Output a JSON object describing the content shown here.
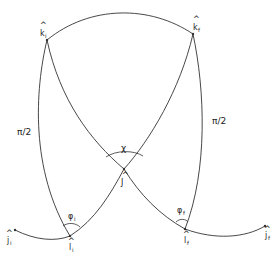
{
  "diagram": {
    "title": "",
    "points": {
      "k_i": {
        "label": "k",
        "hat": "^",
        "sub": "i",
        "x": 47,
        "y": 40
      },
      "k_f": {
        "label": "k",
        "hat": "^",
        "sub": "f",
        "x": 193,
        "y": 34
      },
      "J": {
        "label": "J",
        "hat": "^",
        "x": 124,
        "y": 169
      },
      "l_i": {
        "label": "l",
        "hat": "^",
        "sub": "i",
        "x": 70,
        "y": 236
      },
      "l_f": {
        "label": "l",
        "hat": "^",
        "sub": "f",
        "x": 185,
        "y": 229
      },
      "j_i": {
        "label": "j",
        "hat": "^",
        "sub": "i",
        "x": 15,
        "y": 230
      },
      "j_f": {
        "label": "j",
        "hat": "^",
        "sub": "f",
        "x": 265,
        "y": 226
      }
    },
    "labels": {
      "left_side": "π/2",
      "right_side": "π/2",
      "angle_top": "χ",
      "angle_phi_i": "φ",
      "angle_phi_i_sub": "i",
      "angle_phi_f": "φ",
      "angle_phi_f_sub": "f"
    },
    "edges": [
      [
        "k_i",
        "k_f"
      ],
      [
        "k_i",
        "l_i"
      ],
      [
        "k_i",
        "J"
      ],
      [
        "k_f",
        "l_f"
      ],
      [
        "k_f",
        "J"
      ],
      [
        "J",
        "l_i"
      ],
      [
        "J",
        "l_f"
      ],
      [
        "j_i",
        "l_i"
      ],
      [
        "l_f",
        "j_f"
      ]
    ]
  }
}
